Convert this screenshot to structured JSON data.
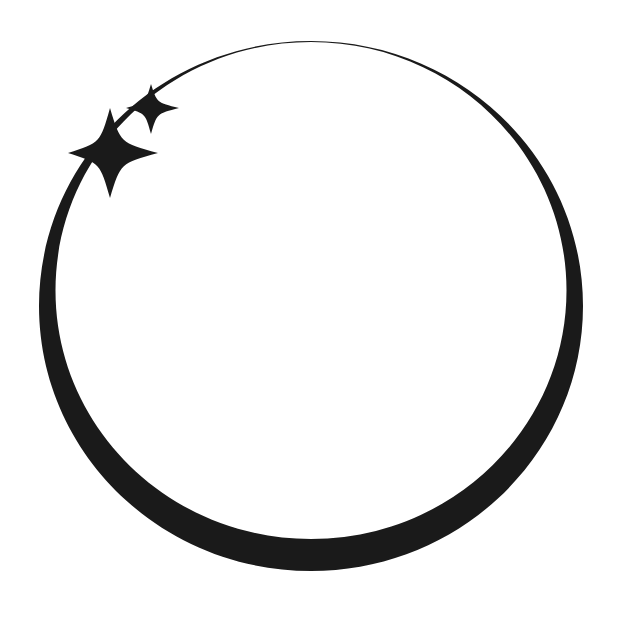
{
  "canvas": {
    "width": 638,
    "height": 625,
    "background_color": "#ffffff",
    "ink_color": "#1a1a1a"
  },
  "artwork": {
    "name": "sparkle-circle-logo",
    "description": "Hand-drawn tapering circular ring with two four-pointed sparkles on the upper-left arc",
    "elements": [
      {
        "id": "ring",
        "name": "tapered-circle-ring",
        "shape": "ring",
        "center_x": 311,
        "center_y": 306,
        "radius_x": 272,
        "radius_y": 265,
        "stroke_min_width": 1,
        "stroke_max_width": 32,
        "thinnest_at": "top",
        "thickest_at": "bottom",
        "color": "#1a1a1a"
      },
      {
        "id": "sparkle-large",
        "name": "four-point-sparkle-large",
        "shape": "four-pointed-star",
        "center_x": 110,
        "center_y": 153,
        "span_x": [
          68,
          158
        ],
        "span_y": [
          108,
          198
        ],
        "arm_up": 45,
        "arm_down": 45,
        "arm_left": 42,
        "arm_right": 48,
        "waist": 13,
        "color": "#1a1a1a"
      },
      {
        "id": "sparkle-small",
        "name": "four-point-sparkle-small",
        "shape": "four-pointed-star",
        "center_x": 151,
        "center_y": 108,
        "span_x": [
          126,
          179
        ],
        "span_y": [
          84,
          134
        ],
        "arm_up": 24,
        "arm_down": 26,
        "arm_left": 25,
        "arm_right": 28,
        "waist": 7,
        "color": "#1a1a1a"
      }
    ]
  }
}
